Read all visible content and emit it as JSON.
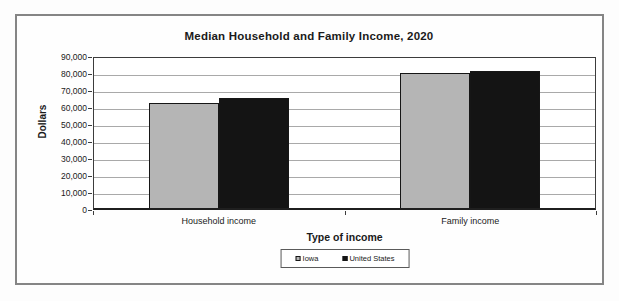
{
  "title": "Median Household and Family Income, 2020",
  "chart_data": {
    "type": "bar",
    "categories": [
      "Household income",
      "Family income"
    ],
    "series": [
      {
        "name": "Iowa",
        "color": "#b5b5b5",
        "values": [
          61800,
          79500
        ]
      },
      {
        "name": "United States",
        "color": "#141414",
        "values": [
          65000,
          80500
        ]
      }
    ],
    "title": "Median Household and Family Income, 2020",
    "xlabel": "Type of income",
    "ylabel": "Dollars",
    "ylim": [
      0,
      90000
    ],
    "ytick_step": 10000,
    "ytick_labels": [
      "0",
      "10,000",
      "20,000",
      "30,000",
      "40,000",
      "50,000",
      "60,000",
      "70,000",
      "80,000",
      "90,000"
    ],
    "grid": true,
    "legend_position": "bottom",
    "colors": {
      "plot_border": "#3c3c3c",
      "gridline": "#a9a9a9",
      "outer_frame": "#858585",
      "text": "#1a1a1a"
    }
  }
}
